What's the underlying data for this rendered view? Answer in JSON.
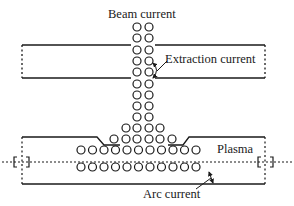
{
  "labels": {
    "beam_current": "Beam current",
    "extraction_current": "Extraction current",
    "plasma": "Plasma",
    "arc_current": "Arc current"
  },
  "colors": {
    "ink": "#1a1a1a",
    "background": "#ffffff"
  },
  "geometry": {
    "column_x": [
      137,
      149
    ],
    "column_rows_y": [
      27,
      38,
      50,
      61,
      72,
      84,
      95,
      106,
      117
    ],
    "funnel_rows": [
      {
        "y": 128,
        "x": [
          126,
          137,
          149,
          160
        ]
      },
      {
        "y": 139,
        "x": [
          114,
          126,
          137,
          149,
          160,
          172
        ]
      }
    ],
    "plasma_row_1": {
      "y": 150,
      "count": 11,
      "x_start": 81,
      "step": 11.5
    },
    "plasma_row_2": {
      "y": 167,
      "count": 11,
      "x_start": 81,
      "step": 11.5
    }
  }
}
